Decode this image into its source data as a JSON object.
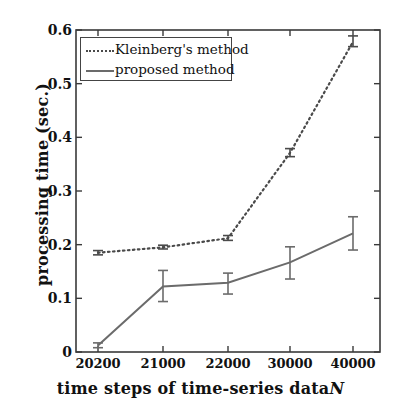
{
  "chart_data": {
    "type": "line",
    "title": "",
    "xlabel": "time steps of time-series data N",
    "ylabel": "processing time (sec.)",
    "categories": [
      "20200",
      "21000",
      "22000",
      "30000",
      "40000"
    ],
    "x_tick_labels": [
      "20200",
      "21000",
      "22000",
      "30000",
      "40000"
    ],
    "y_tick_labels": [
      "0",
      "0.1",
      "0.2",
      "0.3",
      "0.4",
      "0.5",
      "0.6"
    ],
    "y_tick_values": [
      0,
      0.1,
      0.2,
      0.3,
      0.4,
      0.5,
      0.6
    ],
    "ylim": [
      0,
      0.6
    ],
    "grid": false,
    "legend_position": "upper-left",
    "series": [
      {
        "name": "Kleinberg's method",
        "style": "dotted",
        "color": "#4a4a4a",
        "values": [
          0.185,
          0.195,
          0.212,
          0.371,
          0.578
        ],
        "err_low": [
          0.181,
          0.192,
          0.208,
          0.364,
          0.569
        ],
        "err_high": [
          0.189,
          0.199,
          0.217,
          0.379,
          0.589
        ]
      },
      {
        "name": "proposed method",
        "style": "solid",
        "color": "#6b6b6b",
        "values": [
          0.012,
          0.122,
          0.129,
          0.167,
          0.221
        ],
        "err_low": [
          0.008,
          0.094,
          0.108,
          0.136,
          0.19
        ],
        "err_high": [
          0.017,
          0.152,
          0.147,
          0.196,
          0.252
        ]
      }
    ]
  },
  "legend": {
    "items": [
      {
        "label": "Kleinberg's method",
        "style": "dotted"
      },
      {
        "label": "proposed method",
        "style": "solid"
      }
    ]
  },
  "axes": {
    "x_title_main": "time steps of time-series data",
    "x_title_symbol": "N",
    "y_title": "processing time (sec.)"
  },
  "colors": {
    "kleinberg": "#4a4a4a",
    "proposed": "#6b6b6b",
    "axis": "#3a3a3a",
    "background": "#ffffff"
  }
}
